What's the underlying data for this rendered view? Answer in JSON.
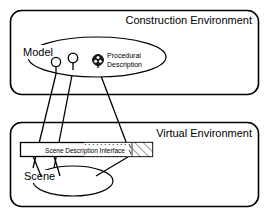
{
  "diagram": {
    "environments": [
      {
        "id": "construction",
        "title": "Construction Environment",
        "container_label": "Model",
        "nodes": [
          {
            "id": "node-1",
            "type": "plain-circle",
            "label": ""
          },
          {
            "id": "node-2",
            "type": "plain-circle",
            "label": ""
          },
          {
            "id": "node-3",
            "type": "hatched-circle",
            "label": "Procedural Description"
          }
        ]
      },
      {
        "id": "virtual",
        "title": "Virtual Environment",
        "container_label": "Scene",
        "interface_label": "Scene Description Interface"
      }
    ],
    "node_label_lines": {
      "procedural_line_1": "Procedural",
      "procedural_line_2": "Description"
    },
    "colors": {
      "stroke": "#000000",
      "background": "#ffffff",
      "hatch": "#000000"
    }
  }
}
